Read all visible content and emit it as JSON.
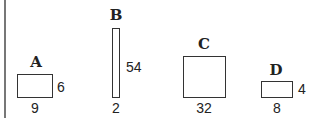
{
  "figure": {
    "stroke_color": "#333333",
    "frame_color": "#777777",
    "shapes": [
      {
        "label": "A",
        "width": "9",
        "height": "6"
      },
      {
        "label": "B",
        "width": "2",
        "height": "54"
      },
      {
        "label": "C",
        "width": "32",
        "height": ""
      },
      {
        "label": "D",
        "width": "8",
        "height": "4"
      }
    ]
  }
}
